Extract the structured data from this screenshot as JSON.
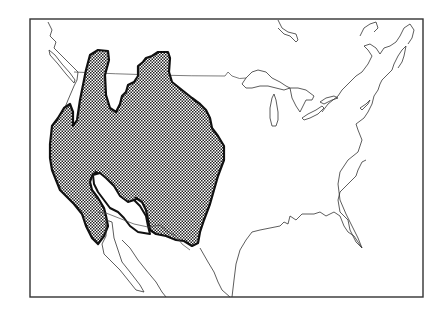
{
  "map": {
    "type": "species range map",
    "region": "North America (United States and southern Canada, northern Mexico)",
    "shading": "stippled/checkered pattern indicating range",
    "colors": {
      "background": "#ffffff",
      "outline": "#111111",
      "coast": "#333333",
      "frame": "#333333",
      "fill_dot": "#222222"
    },
    "features": [
      "Great Lakes",
      "Pacific coast",
      "Atlantic coast",
      "Gulf of Mexico coast",
      "Florida peninsula",
      "Baja California",
      "Vancouver Island",
      "US-Canada border",
      "US-Mexico border"
    ]
  }
}
